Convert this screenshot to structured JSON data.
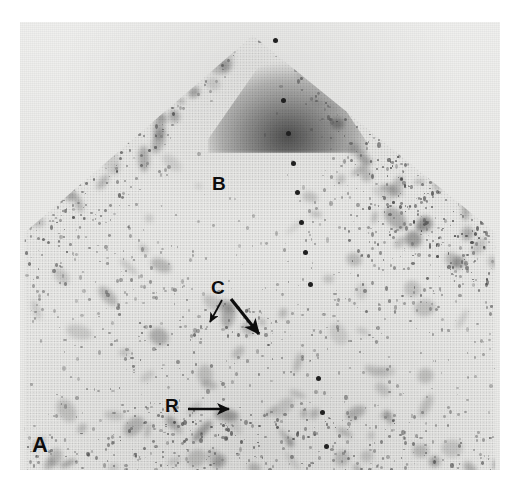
{
  "figure": {
    "panel_label": "A",
    "modality": "ultrasound-sector-scan",
    "background_color": "#ffffff",
    "plate_color": "#ededeb"
  },
  "annotations": {
    "bladder": {
      "label": "B",
      "meaning": "bladder",
      "x": 212,
      "y": 174
    },
    "cervix": {
      "label": "C",
      "meaning": "cervix",
      "x": 211,
      "y": 278
    },
    "rectum": {
      "label": "R",
      "meaning": "rectum",
      "x": 165,
      "y": 396
    }
  },
  "arrows": [
    {
      "name": "cervix-arrow-left",
      "x1": 222,
      "y1": 300,
      "x2": 210,
      "y2": 322,
      "width": 1.8,
      "head": 5
    },
    {
      "name": "cervix-arrow-right",
      "x1": 231,
      "y1": 299,
      "x2": 259,
      "y2": 334,
      "width": 3.2,
      "head": 8
    },
    {
      "name": "rectum-arrow",
      "x1": 188,
      "y1": 409,
      "x2": 229,
      "y2": 409,
      "width": 2.6,
      "head": 7
    }
  ],
  "depth_markers": {
    "name": "depth-marker-dots",
    "color": "#202020",
    "dots": [
      {
        "x": 275,
        "y": 40
      },
      {
        "x": 283,
        "y": 100
      },
      {
        "x": 288,
        "y": 133
      },
      {
        "x": 293,
        "y": 163
      },
      {
        "x": 297,
        "y": 192
      },
      {
        "x": 301,
        "y": 222
      },
      {
        "x": 305,
        "y": 252
      },
      {
        "x": 310,
        "y": 284
      },
      {
        "x": 318,
        "y": 378
      },
      {
        "x": 322,
        "y": 412
      },
      {
        "x": 326,
        "y": 446
      }
    ]
  },
  "sector": {
    "apex_x": 253,
    "apex_y": 35,
    "name": "ultrasound-sector-field"
  }
}
